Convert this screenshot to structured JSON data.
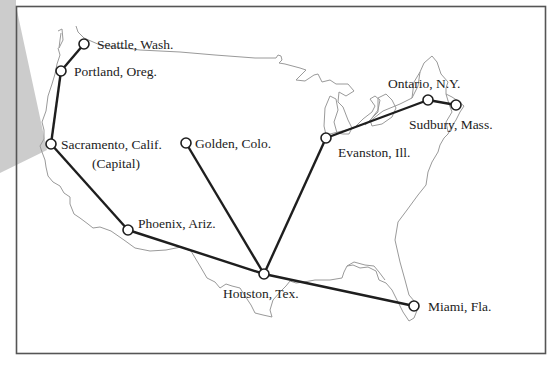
{
  "map": {
    "title": "",
    "colors": {
      "frame": "#555555",
      "outline": "#9a9a9a",
      "route": "#1e1e1e",
      "node_fill": "#ffffff",
      "shade": "#c8c8c8"
    },
    "cities": [
      {
        "id": "seattle",
        "label": "Seattle, Wash.",
        "x": 84,
        "y": 44,
        "lx": 97,
        "ly": 49
      },
      {
        "id": "portland",
        "label": "Portland, Oreg.",
        "x": 61,
        "y": 71,
        "lx": 74,
        "ly": 76
      },
      {
        "id": "sacramento",
        "label": "Sacramento, Calif.",
        "sublabel": "(Capital)",
        "x": 51,
        "y": 144,
        "lx": 61,
        "ly": 149,
        "slx": 92,
        "sly": 168
      },
      {
        "id": "golden",
        "label": "Golden, Colo.",
        "x": 186,
        "y": 143,
        "lx": 195,
        "ly": 148
      },
      {
        "id": "phoenix",
        "label": "Phoenix, Ariz.",
        "x": 128,
        "y": 230,
        "lx": 138,
        "ly": 228
      },
      {
        "id": "houston",
        "label": "Houston, Tex.",
        "x": 264,
        "y": 274,
        "lx": 223,
        "ly": 298
      },
      {
        "id": "evanston",
        "label": "Evanston, Ill.",
        "x": 326,
        "y": 138,
        "lx": 338,
        "ly": 157
      },
      {
        "id": "ontario",
        "label": "Ontario, N.Y.",
        "x": 428,
        "y": 100,
        "lx": 388,
        "ly": 88
      },
      {
        "id": "sudbury",
        "label": "Sudbury, Mass.",
        "x": 456,
        "y": 105,
        "lx": 409,
        "ly": 129
      },
      {
        "id": "miami",
        "label": "Miami, Fla.",
        "x": 414,
        "y": 306,
        "lx": 428,
        "ly": 311
      }
    ],
    "routes": [
      [
        "seattle",
        "portland"
      ],
      [
        "portland",
        "sacramento"
      ],
      [
        "sacramento",
        "phoenix"
      ],
      [
        "phoenix",
        "houston"
      ],
      [
        "golden",
        "houston"
      ],
      [
        "houston",
        "evanston"
      ],
      [
        "evanston",
        "ontario"
      ],
      [
        "ontario",
        "sudbury"
      ],
      [
        "houston",
        "miami"
      ]
    ]
  }
}
